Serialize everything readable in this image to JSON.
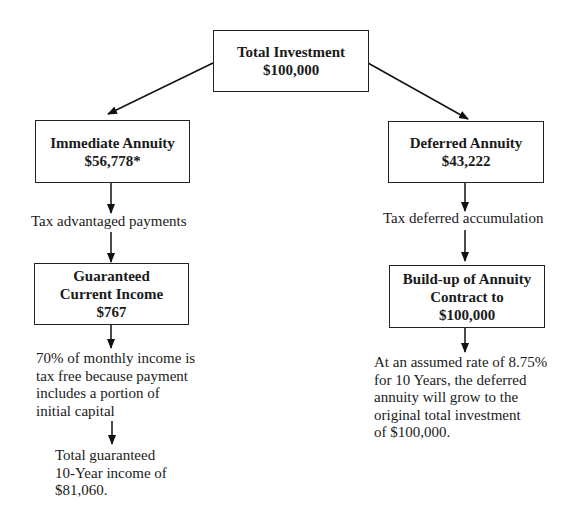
{
  "diagram": {
    "total": {
      "title": "Total Investment",
      "amount": "$100,000"
    },
    "immediate": {
      "title": "Immediate Annuity",
      "amount": "$56,778*"
    },
    "deferred": {
      "title": "Deferred Annuity",
      "amount": "$43,222"
    },
    "left_label": "Tax advantaged payments",
    "right_label": "Tax deferred accumulation",
    "guaranteed": {
      "line1": "Guaranteed",
      "line2": "Current Income",
      "amount": "$767"
    },
    "buildup": {
      "line1": "Build-up of Annuity",
      "line2": "Contract to",
      "amount": "$100,000"
    },
    "left_note": [
      "70% of monthly income is",
      "tax free because payment",
      "includes a portion of",
      "initial capital"
    ],
    "left_total": [
      "Total guaranteed",
      "10-Year income of",
      "$81,060."
    ],
    "right_note": [
      "At an assumed rate of 8.75%",
      "for 10 Years, the deferred",
      "annuity will grow to the",
      "original total investment",
      "of $100,000."
    ]
  }
}
